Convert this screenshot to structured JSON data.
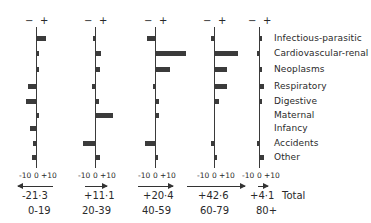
{
  "chart_data": {
    "type": "bar",
    "orientation": "horizontal",
    "title": "",
    "xlabel": "",
    "ylabel": "",
    "categories": [
      "Infectious-parasitic",
      "Cardiovascular-renal",
      "Neoplasms",
      "Respiratory",
      "Digestive",
      "Maternal",
      "Infancy",
      "Accidents",
      "Other"
    ],
    "axis_ticks": [
      "-10",
      "0",
      "+10"
    ],
    "sign_header": {
      "minus": "−",
      "plus": "+"
    },
    "total_label": "Total",
    "grid": false,
    "series": [
      {
        "name": "0-19",
        "total": "-21·3",
        "direction": "left",
        "values": [
          7,
          1,
          1,
          -6,
          -8,
          1,
          -5,
          -2,
          -3
        ]
      },
      {
        "name": "20-39",
        "total": "+11·1",
        "direction": "right",
        "values": [
          -1,
          4,
          3,
          -2,
          2,
          13,
          0,
          -9,
          3
        ]
      },
      {
        "name": "40-59",
        "total": "+20·4",
        "direction": "right",
        "values": [
          -6,
          23,
          11,
          -1,
          2,
          2,
          0,
          -8,
          1
        ]
      },
      {
        "name": "60-79",
        "total": "+42·6",
        "direction": "right",
        "values": [
          -2,
          18,
          9,
          9,
          3,
          0,
          0,
          -2,
          1
        ]
      },
      {
        "name": "80+",
        "total": "+4·1",
        "direction": "right",
        "values": [
          1,
          -1,
          1,
          3,
          1,
          0,
          0,
          -1,
          3
        ]
      }
    ]
  },
  "layout": {
    "axis_x": [
      36,
      95,
      155,
      214,
      259
    ],
    "px_per_unit": 1.3,
    "row_y": [
      38,
      53,
      69,
      86,
      101,
      115,
      128,
      143,
      157
    ],
    "arrows": [
      [
        18,
        53
      ],
      [
        85,
        107
      ],
      [
        138,
        173
      ],
      [
        187,
        245
      ],
      [
        258,
        268
      ]
    ],
    "total_x": [
      22,
      84,
      143,
      198,
      250
    ],
    "age_x": [
      28,
      82,
      142,
      200,
      256
    ]
  }
}
